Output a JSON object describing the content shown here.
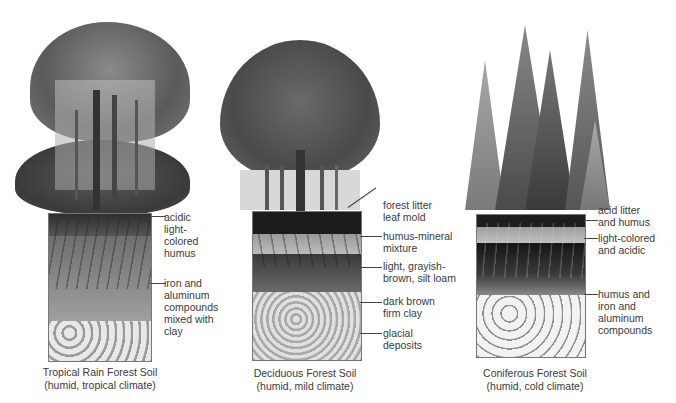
{
  "panels": [
    {
      "id": "tropical",
      "caption_title": "Tropical Rain Forest Soil",
      "caption_sub": "(humid, tropical climate)",
      "labels": [
        "acidic\nlight-\ncolored\nhumus",
        "iron and\naluminum\ncompounds\nmixed with\nclay"
      ]
    },
    {
      "id": "deciduous",
      "caption_title": "Deciduous Forest Soil",
      "caption_sub": "(humid, mild climate)",
      "labels": [
        "forest litter\nleaf mold",
        "humus-mineral\nmixture",
        "light, grayish-\nbrown, silt loam",
        "dark brown\nfirm clay",
        "glacial\ndeposits"
      ]
    },
    {
      "id": "coniferous",
      "caption_title": "Coniferous Forest Soil",
      "caption_sub": "(humid, cold climate)",
      "labels": [
        "acid litter\nand humus",
        "light-colored\nand acidic",
        "humus and\niron and\naluminum\ncompounds"
      ]
    }
  ],
  "colors": {
    "foliage_dark": "#3d3d3d",
    "foliage_mid": "#6e6e6e",
    "foliage_light": "#9a9a9a",
    "soil_dark": "#1e1e1e",
    "soil_mid": "#8a8a8a",
    "soil_light": "#c8c8c8",
    "rock": "#e6e6e6"
  }
}
